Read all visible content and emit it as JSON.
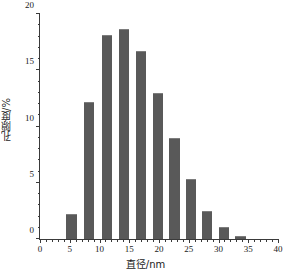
{
  "chart_data": {
    "type": "bar",
    "title": "",
    "subtitle": "",
    "xlabel": "直径/nm",
    "ylabel": "孔隙度/%",
    "xlim": [
      0,
      40
    ],
    "ylim": [
      0,
      20
    ],
    "grid": false,
    "legend": null,
    "bar_color": "#595959",
    "bar_width_units": 1.7,
    "x_major_ticks": [
      0,
      5,
      10,
      15,
      20,
      25,
      30,
      35,
      40
    ],
    "x_major_tick_labels": [
      "0",
      "5",
      "10",
      "15",
      "20",
      "25",
      "30",
      "35",
      "40"
    ],
    "x_minor_tick_step": 1,
    "y_major_ticks": [
      0,
      5,
      10,
      15,
      20
    ],
    "y_major_tick_labels": [
      "0",
      "5",
      "10",
      "15",
      "20"
    ],
    "y_minor_tick_step": 1,
    "x": [
      5.3,
      8.3,
      11.2,
      14.1,
      17.0,
      19.8,
      22.6,
      25.4,
      28.1,
      30.9,
      33.7
    ],
    "values": [
      2.2,
      12.2,
      18.1,
      18.7,
      16.7,
      13.0,
      9.0,
      5.3,
      2.5,
      1.1,
      0.3
    ],
    "categories": [
      "5.3",
      "8.3",
      "11.2",
      "14.1",
      "17.0",
      "19.8",
      "22.6",
      "25.4",
      "28.1",
      "30.9",
      "33.7"
    ],
    "annotations": []
  }
}
